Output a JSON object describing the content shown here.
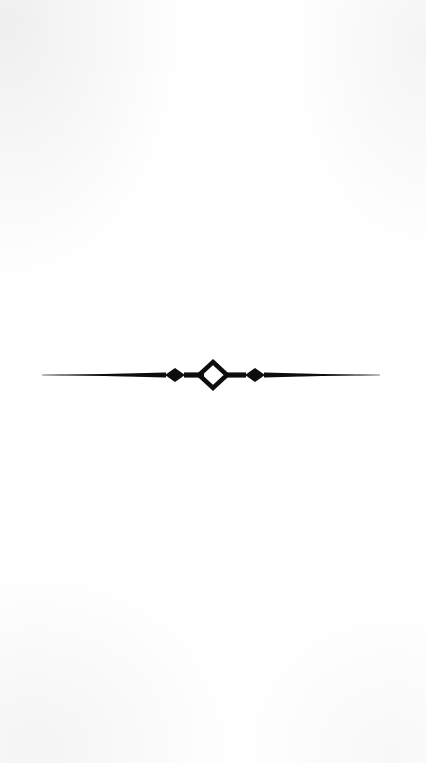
{
  "page": {
    "width_px": 426,
    "height_px": 763,
    "background_color": "#ffffff",
    "content_description": "scanned printer's ornamental divider rule"
  },
  "ornament": {
    "name": "ornamental-divider-rule",
    "ink_color": "#0d0d0d",
    "center_x_px": 213,
    "baseline_y_px": 375,
    "rule_start_x_px": 42,
    "rule_end_x_px": 380,
    "elements": [
      {
        "element": "tapered-hairline-left",
        "shape": "line",
        "from_x_px": 42,
        "to_x_px": 166,
        "style": "hairline tapering thicker toward centre"
      },
      {
        "element": "solid-diamond-left",
        "shape": "filled-diamond",
        "center_x_px": 175,
        "half_width_px": 10,
        "half_height_px": 7
      },
      {
        "element": "connector-bar-left",
        "shape": "line",
        "from_x_px": 185,
        "to_x_px": 203
      },
      {
        "element": "open-diamond-center",
        "shape": "outline-diamond",
        "center_x_px": 213,
        "half_width_px": 14,
        "half_height_px": 13,
        "stroke_width_px": 4.5
      },
      {
        "element": "connector-bar-right",
        "shape": "line",
        "from_x_px": 227,
        "to_x_px": 245
      },
      {
        "element": "solid-diamond-right",
        "shape": "filled-diamond",
        "center_x_px": 255,
        "half_width_px": 10,
        "half_height_px": 7
      },
      {
        "element": "tapered-hairline-right",
        "shape": "line",
        "from_x_px": 264,
        "to_x_px": 380,
        "style": "hairline tapering thinner toward edge"
      }
    ]
  }
}
